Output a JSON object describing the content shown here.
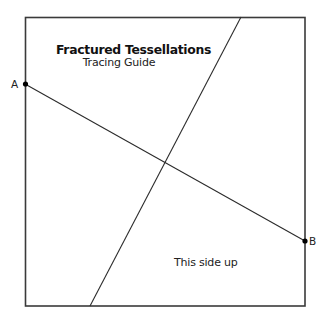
{
  "guide": {
    "title": "Fractured Tessellations",
    "subtitle": "Tracing Guide",
    "orientation_note": "This side up",
    "points": [
      {
        "label": "A",
        "x": 25,
        "y": 84
      },
      {
        "label": "B",
        "x": 305,
        "y": 241
      }
    ],
    "frame": {
      "x1": 25,
      "y1": 17,
      "x2": 305,
      "y2": 306
    },
    "lines": [
      {
        "name": "cut-line-a-b",
        "x1": 25,
        "y1": 84,
        "x2": 305,
        "y2": 241
      },
      {
        "name": "cut-line-diagonal",
        "x1": 241,
        "y1": 17,
        "x2": 90,
        "y2": 306
      }
    ],
    "colors": {
      "stroke": "#2b2b2b",
      "background": "#ffffff"
    }
  }
}
